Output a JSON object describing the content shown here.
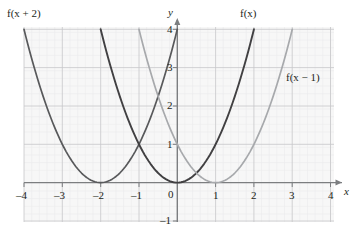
{
  "chart_data": {
    "type": "line",
    "title": "",
    "xlabel": "x",
    "ylabel": "y",
    "xlim": [
      -4.2,
      4.2
    ],
    "ylim": [
      -1.05,
      4.3
    ],
    "grid": true,
    "minor_grid": true,
    "legend": "inline-curve-labels",
    "x_ticks": [
      "-4",
      "-3",
      "-2",
      "-1",
      "0",
      "1",
      "2",
      "3",
      "4"
    ],
    "x_tick_values": [
      -4,
      -3,
      -2,
      -1,
      0,
      1,
      2,
      3,
      4
    ],
    "y_ticks": [
      "-1",
      "1",
      "2",
      "3",
      "4"
    ],
    "y_tick_values": [
      -1,
      1,
      2,
      3,
      4
    ],
    "origin_label": "0",
    "series": [
      {
        "name": "f(x + 2)",
        "label": "f(x + 2)",
        "color": "#58595b",
        "vertex": [
          -2,
          0
        ],
        "equation": "y = (x + 2)^2",
        "points": [
          [
            -4.0,
            4.0
          ],
          [
            -3.5,
            2.25
          ],
          [
            -3.0,
            1.0
          ],
          [
            -2.5,
            0.25
          ],
          [
            -2.0,
            0.0
          ],
          [
            -1.5,
            0.25
          ],
          [
            -1.0,
            1.0
          ],
          [
            -0.5,
            2.25
          ],
          [
            0.0,
            4.0
          ],
          [
            0.1,
            4.41
          ]
        ]
      },
      {
        "name": "f(x)",
        "label": "f(x)",
        "color": "#414042",
        "vertex": [
          0,
          0
        ],
        "equation": "y = x^2",
        "points": [
          [
            -2.1,
            4.41
          ],
          [
            -2.0,
            4.0
          ],
          [
            -1.5,
            2.25
          ],
          [
            -1.0,
            1.0
          ],
          [
            -0.5,
            0.25
          ],
          [
            0.0,
            0.0
          ],
          [
            0.5,
            0.25
          ],
          [
            1.0,
            1.0
          ],
          [
            1.5,
            2.25
          ],
          [
            2.0,
            4.0
          ],
          [
            2.1,
            4.41
          ]
        ]
      },
      {
        "name": "f(x - 1)",
        "label": "f(x - 1)",
        "color": "#a7a9ac",
        "vertex": [
          1,
          0
        ],
        "equation": "y = (x - 1)^2",
        "points": [
          [
            -1.1,
            4.41
          ],
          [
            -1.0,
            4.0
          ],
          [
            -0.5,
            2.25
          ],
          [
            0.0,
            1.0
          ],
          [
            0.5,
            0.25
          ],
          [
            1.0,
            0.0
          ],
          [
            1.5,
            0.25
          ],
          [
            2.0,
            1.0
          ],
          [
            2.5,
            2.25
          ],
          [
            3.0,
            4.0
          ],
          [
            3.1,
            4.41
          ]
        ]
      }
    ],
    "colors": {
      "grid_major": "#c8c8cc",
      "grid_minor": "#ececed",
      "plot_background": "#f7f7f7",
      "axis": "#808285",
      "text": "#231f20"
    }
  },
  "curve_labels": {
    "left": "f(x + 2)",
    "middle": "f(x)",
    "right": "f(x − 1)"
  },
  "axis_names": {
    "x": "x",
    "y": "y"
  },
  "ticks": {
    "x": {
      "m4": "–4",
      "m3": "–3",
      "m2": "–2",
      "m1": "–1",
      "p1": "1",
      "p2": "2",
      "p3": "3",
      "p4": "4"
    },
    "y": {
      "p1": "1",
      "p2": "2",
      "p3": "3",
      "p4": "4",
      "m1": "–1"
    },
    "origin": "0"
  }
}
